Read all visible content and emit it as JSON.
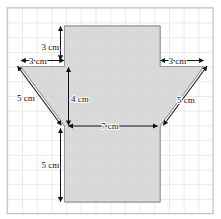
{
  "figure": {
    "units": "cm",
    "grid": {
      "cell_size_px": 14.7,
      "columns": 14,
      "rows": 14,
      "line_color": "#cfcfcf",
      "border_color": "#b9b9b9",
      "background": "#ffffff"
    },
    "shape": {
      "fill_color": "#d9d9d9",
      "stroke_color": "#8c8c8c",
      "description": "Vertical rectangle with a V-shaped notch cut into its upper-left and upper-right, forming a funnel/trapezoid over a rectangle"
    },
    "annotations": {
      "color": "#111111",
      "items": [
        {
          "id": "top-vertical-3cm",
          "label": "3 cm",
          "orientation": "vertical",
          "measures": "height of rectangle above the funnel mouth"
        },
        {
          "id": "left-top-3cm",
          "label": "3 cm",
          "orientation": "horizontal",
          "measures": "horizontal offset of left slant at top"
        },
        {
          "id": "right-top-3cm",
          "label": "3 cm",
          "orientation": "horizontal",
          "measures": "horizontal offset of right slant at top"
        },
        {
          "id": "left-slant-5cm",
          "label": "5 cm",
          "orientation": "diagonal",
          "measures": "length of left slanted side"
        },
        {
          "id": "right-slant-5cm",
          "label": "5 cm",
          "orientation": "diagonal",
          "measures": "length of right slanted side"
        },
        {
          "id": "inner-vertical-4cm",
          "label": "4 cm",
          "orientation": "vertical",
          "measures": "vertical drop of the funnel"
        },
        {
          "id": "middle-7cm",
          "label": "7 cm",
          "orientation": "horizontal",
          "measures": "width of the rectangle / funnel throat"
        },
        {
          "id": "bottom-vertical-5cm",
          "label": "5 cm",
          "orientation": "vertical",
          "measures": "height of rectangle below the funnel throat"
        }
      ]
    }
  }
}
